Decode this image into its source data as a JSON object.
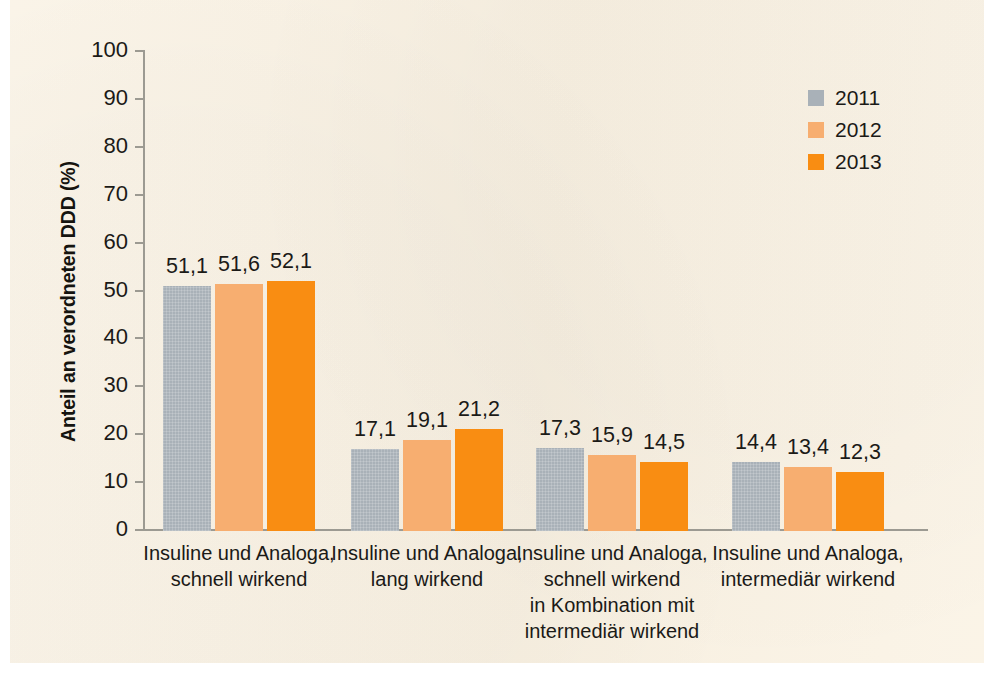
{
  "chart_data": {
    "type": "bar",
    "title": "",
    "xlabel": "",
    "ylabel": "Anteil an verordneten DDD (%)",
    "ylim": [
      0,
      100
    ],
    "ytick_step": 10,
    "yticks": [
      "100",
      "90",
      "80",
      "70",
      "60",
      "50",
      "40",
      "30",
      "20",
      "10",
      "0"
    ],
    "grid": false,
    "legend_position": "top-right",
    "value_label_decimal_separator": ",",
    "categories": [
      "Insuline und Analoga, schnell wirkend",
      "Insuline und Analoga, lang wirkend",
      "Insuline und Analoga, schnell wirkend in Kombination mit intermediär wirkend",
      "Insuline und Analoga, intermediär wirkend"
    ],
    "category_label_lines": [
      [
        "Insuline und Analoga,",
        "schnell wirkend"
      ],
      [
        "Insuline und Analoga,",
        "lang wirkend"
      ],
      [
        "Insuline und Analoga,",
        "schnell wirkend",
        "in Kombination mit",
        "intermediär wirkend"
      ],
      [
        "Insuline und Analoga,",
        "intermediär wirkend"
      ]
    ],
    "series": [
      {
        "name": "2011",
        "color": "#a9b1b8",
        "values": [
          51.1,
          17.1,
          17.3,
          14.4
        ],
        "labels": [
          "51,1",
          "17,1",
          "17,3",
          "14,4"
        ]
      },
      {
        "name": "2012",
        "color": "#f7ae70",
        "values": [
          51.6,
          19.1,
          15.9,
          13.4
        ],
        "labels": [
          "51,6",
          "19,1",
          "15,9",
          "13,4"
        ]
      },
      {
        "name": "2013",
        "color": "#f98d12",
        "values": [
          52.1,
          21.2,
          14.5,
          12.3
        ],
        "labels": [
          "52,1",
          "21,2",
          "14,5",
          "12,3"
        ]
      }
    ]
  },
  "legend": {
    "items": [
      {
        "label": "2011",
        "color": "#a9b1b8"
      },
      {
        "label": "2012",
        "color": "#f7ae70"
      },
      {
        "label": "2013",
        "color": "#f98d12"
      }
    ]
  },
  "colors": {
    "background": "#faf2e3",
    "page": "#ffffff",
    "axis": "#9c9a92",
    "text": "#1b1a17",
    "series_2011": "#a9b1b8",
    "series_2012": "#f7ae70",
    "series_2013": "#f98d12"
  }
}
